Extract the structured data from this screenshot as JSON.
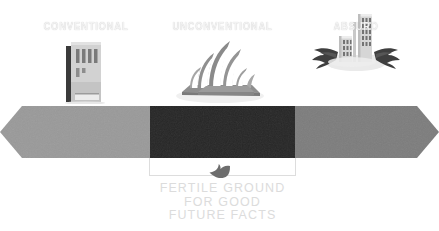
{
  "diagram": {
    "background_color": "#ffffff"
  },
  "spectrum": {
    "type": "double-headed-arrow",
    "segments": [
      {
        "id": "conventional",
        "label": "CONVENTIONAL",
        "fill": "#9a9a9a",
        "text_color": "#f2f2f2"
      },
      {
        "id": "unconventional",
        "label": "UNCONVENTIONAL",
        "fill": "#262626",
        "text_color": "#f2f2f2"
      },
      {
        "id": "absurd",
        "label": "ABSURD",
        "fill": "#7d7d7d",
        "text_color": "#f2f2f2"
      }
    ]
  },
  "illustrations": [
    {
      "id": "conventional",
      "icon_name": "office-building-icon",
      "description": "plain rectangular office tower"
    },
    {
      "id": "unconventional",
      "icon_name": "sydney-opera-house-icon",
      "description": "Sydney Opera House with shell sails"
    },
    {
      "id": "absurd",
      "icon_name": "winged-flying-building-icon",
      "description": "skyscrapers on a cloud with dark wings"
    }
  ],
  "annotation": {
    "bracket_color": "#dddddd",
    "pointer_icon": "thumbs-up-pointer-icon",
    "pointer_color": "#6d6d6d",
    "caption_color": "#dcdcdc",
    "caption_lines": [
      "FERTILE GROUND",
      "FOR GOOD",
      "FUTURE FACTS"
    ]
  }
}
